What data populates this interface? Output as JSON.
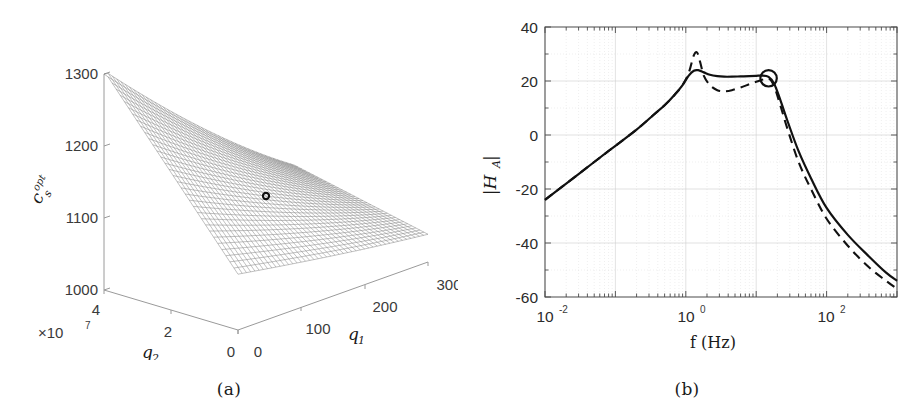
{
  "figure": {
    "panels": [
      {
        "id": "a",
        "caption": "(a)"
      },
      {
        "id": "b",
        "caption": "(b)"
      }
    ]
  },
  "panel_a": {
    "caption": "(a)",
    "axis_labels": {
      "z": "c",
      "z_sub": "s",
      "z_sup": "opt",
      "x": "q",
      "x_sub": "1",
      "y": "q",
      "y_sub": "2"
    },
    "y_exponent_prefix": "×10",
    "y_exponent_power": "7",
    "z_ticks": [
      "1000",
      "1100",
      "1200",
      "1300"
    ],
    "x_ticks": [
      "0",
      "100",
      "200",
      "300"
    ],
    "y_ticks": [
      "0",
      "2",
      "4"
    ],
    "marker": {
      "label": "optimum-point",
      "color": "#111111"
    },
    "mesh_color": "#6d6d6d",
    "axis_color": "#9a9a9a"
  },
  "panel_b": {
    "caption": "(b)",
    "axis_labels": {
      "y": "|H",
      "y_sub": "A",
      "y_tail": "|",
      "x": "f (Hz)"
    },
    "y_ticks": [
      "40",
      "20",
      "0",
      "-20",
      "-40",
      "-60"
    ],
    "x_ticks": [
      {
        "mantissa": "10",
        "exponent": "-2"
      },
      {
        "mantissa": "10",
        "exponent": "0"
      },
      {
        "mantissa": "10",
        "exponent": "2"
      }
    ],
    "marker": {
      "label": "design-point-circle",
      "color": "#111111"
    },
    "curve_color": "#111111",
    "grid_color": "#d9d9d9"
  },
  "chart_data": [
    {
      "panel": "a",
      "type": "surface",
      "title": "",
      "xlabel": "q_1",
      "ylabel": "q_2",
      "zlabel": "c_s^{opt}",
      "xlim": [
        0,
        300
      ],
      "ylim": [
        0,
        40000000
      ],
      "zlim": [
        1000,
        1300
      ],
      "y_scale_exponent": 7,
      "xticks": [
        0,
        100,
        200,
        300
      ],
      "yticks": [
        0,
        2,
        4
      ],
      "zticks": [
        1000,
        1100,
        1200,
        1300
      ],
      "grid": false,
      "legend": "none",
      "mesh_style": "wireframe",
      "marker_point": {
        "q1": 120,
        "q2": 1.6,
        "cs_opt": 1120
      },
      "description": "Curved wireframe mesh surface of optimal stiffness c_s^{opt} as a function of q_1 and q_2, rising toward high q_2 / low q_1 and sloping down toward high q_1."
    },
    {
      "panel": "b",
      "type": "line",
      "title": "",
      "xlabel": "f (Hz)",
      "ylabel": "|H_A|",
      "xscale": "log",
      "xlim": [
        0.01,
        1000
      ],
      "ylim": [
        -60,
        40
      ],
      "xticks": [
        0.01,
        1,
        100
      ],
      "yticks": [
        -60,
        -40,
        -20,
        0,
        20,
        40
      ],
      "grid": true,
      "legend": "none",
      "marker_point": {
        "f": 15.0,
        "mag": 21.0
      },
      "series": [
        {
          "name": "optimized",
          "style": "solid",
          "x": [
            0.01,
            0.02,
            0.05,
            0.1,
            0.2,
            0.35,
            0.5,
            0.7,
            0.9,
            1.1,
            1.3,
            1.5,
            1.8,
            2.2,
            2.8,
            3.5,
            4.5,
            6,
            8,
            10,
            12,
            15,
            18,
            22,
            28,
            40,
            60,
            100,
            200,
            400,
            700,
            1000
          ],
          "y": [
            -24,
            -18,
            -10,
            -4,
            2,
            7.5,
            11,
            15,
            18.5,
            22,
            23.8,
            24,
            23.2,
            22.3,
            21.8,
            21.6,
            21.6,
            21.7,
            21.8,
            21.9,
            22,
            21.5,
            19,
            13,
            5,
            -6,
            -16,
            -27,
            -37,
            -45,
            -51,
            -54
          ]
        },
        {
          "name": "nominal",
          "style": "dashed",
          "x": [
            0.01,
            0.02,
            0.05,
            0.1,
            0.2,
            0.35,
            0.5,
            0.7,
            0.9,
            1.1,
            1.3,
            1.45,
            1.6,
            1.8,
            2.2,
            2.8,
            3.5,
            4.5,
            6,
            8,
            10,
            12,
            15,
            18,
            22,
            28,
            40,
            60,
            100,
            200,
            400,
            700,
            1000
          ],
          "y": [
            -24,
            -18,
            -10,
            -4,
            2,
            7.5,
            11,
            15,
            18.5,
            23,
            29.5,
            30.5,
            27,
            22,
            18.5,
            16.6,
            16.2,
            16.6,
            17.6,
            18.8,
            19.7,
            20.4,
            21,
            18,
            11,
            2,
            -10,
            -20,
            -31,
            -41,
            -49,
            -54,
            -57
          ]
        }
      ],
      "description": "Frequency response magnitude |H_A| versus frequency on a log axis. Solid curve shows a flattened twin-peak plateau near 21-24 dB between 1 and 15 Hz; dashed curve shows a sharp 30 dB resonance near 1.4 Hz, a dip to 16 dB, then a second rise to 21 dB at 15 Hz. Both roll off at high frequency, the dashed slightly lower."
    }
  ]
}
